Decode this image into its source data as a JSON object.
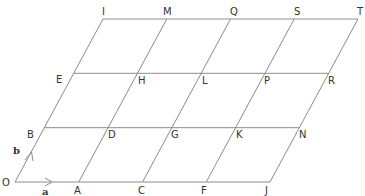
{
  "diagram": {
    "colors": {
      "lines": "#8c8c8c",
      "text": "#333333",
      "background": "#ffffff"
    },
    "grid": {
      "cols": 4,
      "rows": 3
    },
    "vectors": [
      {
        "name": "a",
        "label": "a",
        "direction": "horizontal"
      },
      {
        "name": "b",
        "label": "b",
        "direction": "slanted"
      }
    ],
    "points": [
      {
        "label": "O",
        "i": 0,
        "j": 0
      },
      {
        "label": "A",
        "i": 1,
        "j": 0
      },
      {
        "label": "C",
        "i": 2,
        "j": 0
      },
      {
        "label": "F",
        "i": 3,
        "j": 0
      },
      {
        "label": "J",
        "i": 4,
        "j": 0
      },
      {
        "label": "B",
        "i": 0,
        "j": 1
      },
      {
        "label": "D",
        "i": 1,
        "j": 1
      },
      {
        "label": "G",
        "i": 2,
        "j": 1
      },
      {
        "label": "K",
        "i": 3,
        "j": 1
      },
      {
        "label": "N",
        "i": 4,
        "j": 1
      },
      {
        "label": "E",
        "i": 0,
        "j": 2
      },
      {
        "label": "H",
        "i": 1,
        "j": 2
      },
      {
        "label": "L",
        "i": 2,
        "j": 2
      },
      {
        "label": "P",
        "i": 3,
        "j": 2
      },
      {
        "label": "R",
        "i": 4,
        "j": 2
      },
      {
        "label": "I",
        "i": 0,
        "j": 3
      },
      {
        "label": "M",
        "i": 1,
        "j": 3
      },
      {
        "label": "Q",
        "i": 2,
        "j": 3
      },
      {
        "label": "S",
        "i": 3,
        "j": 3
      },
      {
        "label": "T",
        "i": 4,
        "j": 3
      }
    ]
  }
}
